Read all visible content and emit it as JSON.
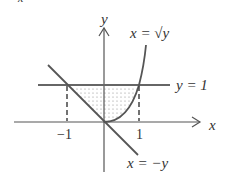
{
  "diagram": {
    "axes": {
      "x_label": "x",
      "y_label": "y"
    },
    "curves": [
      {
        "name": "sqrt-curve",
        "label": "x = √y"
      },
      {
        "name": "horizontal-line",
        "label": "y = 1"
      },
      {
        "name": "diagonal-line",
        "label": "x = −y"
      }
    ],
    "ticks": {
      "neg_one": "−1",
      "one": "1"
    },
    "corner_glyph": "x"
  }
}
